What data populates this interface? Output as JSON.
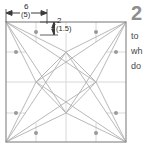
{
  "figure": {
    "dimensions": {
      "width_label": "6",
      "width_alt_label": "(5)",
      "height_label": "2",
      "height_alt_label": "(1.5)"
    },
    "colors": {
      "border": "#8c8c8c",
      "construction_line": "#b3b3b3",
      "gridline": "#d8d8d8",
      "dot": "#9a9a9a",
      "dimension_line": "#3a3a3a",
      "background": "#ffffff",
      "question_number": "#8e8e8e",
      "body_text": "#4a4a4a"
    },
    "square": {
      "x": 6,
      "y": 22,
      "size": 120
    },
    "dots": [
      {
        "cx": 36,
        "cy": 32
      },
      {
        "cx": 96,
        "cy": 32
      },
      {
        "cx": 16,
        "cy": 52
      },
      {
        "cx": 116,
        "cy": 52
      },
      {
        "cx": 16,
        "cy": 113
      },
      {
        "cx": 116,
        "cy": 113
      },
      {
        "cx": 36,
        "cy": 133
      },
      {
        "cx": 96,
        "cy": 133
      }
    ]
  },
  "text_column": {
    "question_number": "2",
    "body_lines": [
      "to",
      "wh",
      "do"
    ]
  }
}
